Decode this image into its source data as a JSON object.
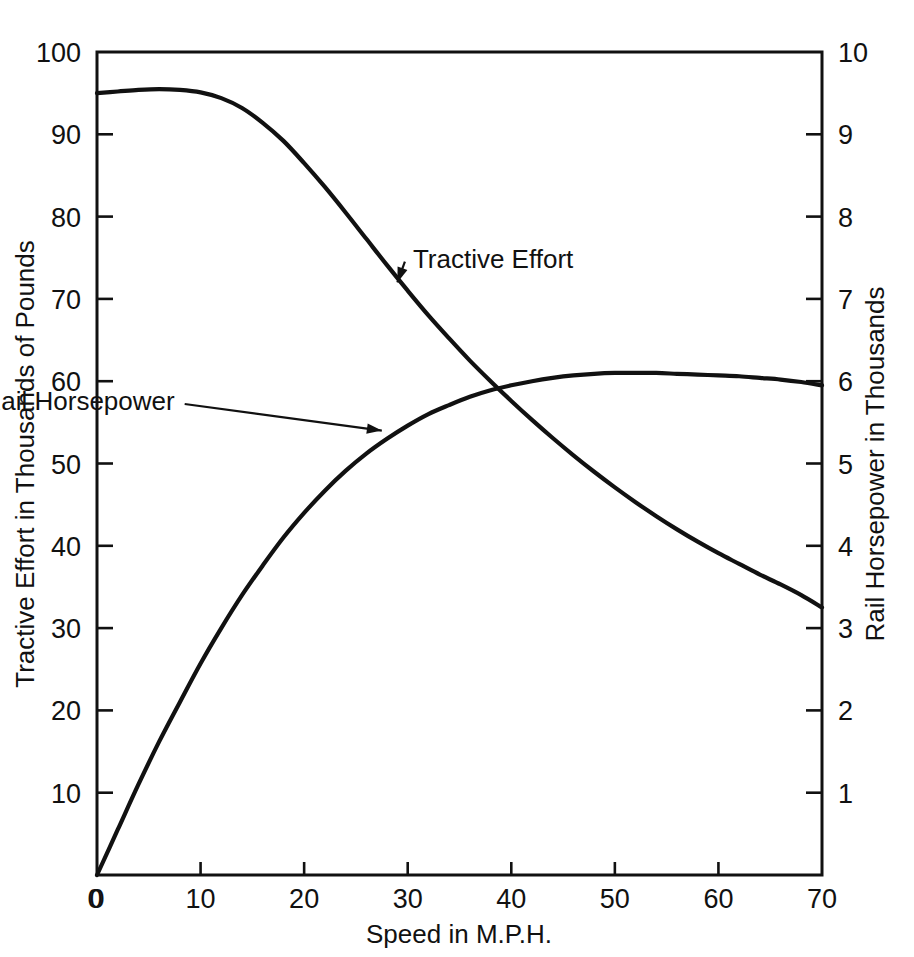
{
  "chart_data": {
    "type": "line",
    "title": "",
    "xlabel": "Speed in M.P.H.",
    "ylabel": "Tractive Effort in Thousands of Pounds",
    "y2label": "Rail Horsepower in Thousands",
    "xlim": [
      0,
      70
    ],
    "ylim": [
      0,
      100
    ],
    "y2lim": [
      0,
      10
    ],
    "grid": false,
    "legend_position": "inline-annotations",
    "xticks": [
      0,
      10,
      20,
      30,
      40,
      50,
      60,
      70
    ],
    "xtick_labels": [
      "0",
      "10",
      "20",
      "30",
      "40",
      "50",
      "60",
      "70"
    ],
    "yticks": [
      0,
      10,
      20,
      30,
      40,
      50,
      60,
      70,
      80,
      90,
      100
    ],
    "ytick_labels": [
      "0",
      "10",
      "20",
      "30",
      "40",
      "50",
      "60",
      "70",
      "80",
      "90",
      "100"
    ],
    "y2ticks": [
      0,
      1,
      2,
      3,
      4,
      5,
      6,
      7,
      8,
      9,
      10
    ],
    "y2tick_labels": [
      "0",
      "1",
      "2",
      "3",
      "4",
      "5",
      "6",
      "7",
      "8",
      "9",
      "10"
    ],
    "x": [
      0,
      2,
      4,
      6,
      8,
      10,
      12,
      14,
      16,
      18,
      20,
      22,
      24,
      26,
      28,
      30,
      32,
      34,
      36,
      38,
      40,
      42,
      44,
      46,
      48,
      50,
      52,
      54,
      56,
      58,
      60,
      62,
      64,
      66,
      68,
      70
    ],
    "series": [
      {
        "name": "Tractive Effort",
        "axis": "left",
        "units": "Thousands of Pounds",
        "values": [
          95.0,
          95.2,
          95.4,
          95.5,
          95.4,
          95.1,
          94.4,
          93.2,
          91.4,
          89.2,
          86.5,
          83.6,
          80.5,
          77.3,
          74.1,
          71.0,
          68.0,
          65.2,
          62.5,
          60.0,
          57.6,
          55.3,
          53.1,
          51.0,
          49.0,
          47.1,
          45.3,
          43.6,
          42.0,
          40.5,
          39.1,
          37.8,
          36.5,
          35.3,
          34.0,
          32.5
        ]
      },
      {
        "name": "Rail Horsepower",
        "axis": "right",
        "units": "Thousands",
        "values": [
          0.0,
          0.55,
          1.1,
          1.62,
          2.1,
          2.57,
          3.0,
          3.4,
          3.76,
          4.1,
          4.4,
          4.67,
          4.91,
          5.12,
          5.3,
          5.46,
          5.6,
          5.71,
          5.81,
          5.89,
          5.95,
          6.0,
          6.04,
          6.07,
          6.09,
          6.1,
          6.1,
          6.1,
          6.09,
          6.08,
          6.07,
          6.06,
          6.04,
          6.02,
          5.99,
          5.95
        ]
      }
    ],
    "annotations": [
      {
        "text": "Tractive Effort",
        "label_x": 30.5,
        "label_y": 73.8,
        "point_x": 29.0,
        "point_y": 72.0
      },
      {
        "text": "Rail Horsepower",
        "label_x": 7.5,
        "label_y": 56.5,
        "point_x": 27.5,
        "point_y": 54.0
      }
    ],
    "crossing_point": {
      "speed_mph": 38,
      "tractive_effort": 60,
      "rail_horsepower": 6.0
    }
  }
}
